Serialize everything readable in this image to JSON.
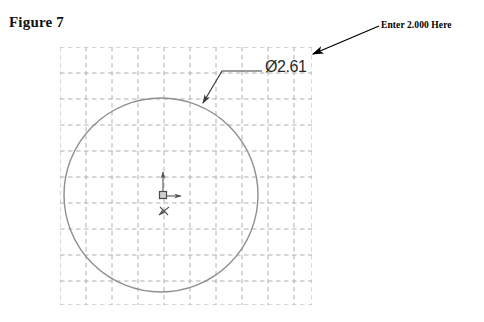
{
  "figure": {
    "label": "Figure 7"
  },
  "annotation": {
    "callout_text": "Enter 2.000 Here",
    "arrow_color": "#000000",
    "arrow_from_x": 379,
    "arrow_from_y": 26,
    "arrow_to_x": 311,
    "arrow_to_y": 55
  },
  "sketch": {
    "app": "CAD sketch view",
    "background_color": "#ffffff",
    "grid": {
      "visible": true,
      "style": "dashed",
      "color": "#9a9a9a",
      "minor_spacing_px": 26,
      "left": 60,
      "top": 47,
      "right": 312,
      "bottom": 305
    },
    "circle": {
      "center_x": 161,
      "center_y": 195,
      "radius_px": 97,
      "color": "#8f8f8f",
      "stroke_width": 1.4
    },
    "origin": {
      "x": 163,
      "y": 195,
      "marker": "origin-square",
      "color": "#555555",
      "x_axis_label": "X",
      "y_axis_label": "Y",
      "z_axis_label": "Z"
    },
    "dimension": {
      "symbol": "Ø",
      "value": "2.61",
      "display": "Ø2.61",
      "color": "#2b2b2b",
      "leader": {
        "attach_x": 202,
        "attach_y": 104,
        "elbow_x": 222,
        "elbow_y": 71,
        "end_x": 262,
        "end_y": 71,
        "color": "#3c3c3c"
      }
    }
  }
}
